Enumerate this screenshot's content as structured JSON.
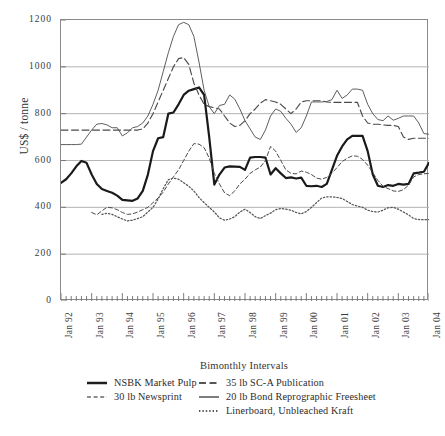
{
  "chart_data": {
    "type": "line",
    "title": "",
    "xlabel": "Bimonthly Intervals",
    "ylabel": "US$ / tonne",
    "ylim": [
      0,
      1200
    ],
    "y_ticks": [
      0,
      200,
      400,
      600,
      800,
      1000,
      1200
    ],
    "grid": true,
    "legend_position": "bottom",
    "x_tick_labels": [
      "Jan 92",
      "Jan 93",
      "Jan 94",
      "Jan 95",
      "Jan 96",
      "Jan 97",
      "Jan 98",
      "Jan 99",
      "Jan 00",
      "Jan 01",
      "Jan 02",
      "Jan 03",
      "Jan 04"
    ],
    "x_interval_note": "bimonthly ticks; labeled each January",
    "n_points": 73,
    "series": [
      {
        "name": "NSBK Market Pulp",
        "style": "solid-thick",
        "color": "#1a1a1a",
        "values": [
          505,
          520,
          545,
          575,
          598,
          590,
          540,
          500,
          478,
          470,
          462,
          450,
          432,
          430,
          428,
          438,
          470,
          540,
          640,
          695,
          700,
          800,
          805,
          840,
          880,
          898,
          905,
          912,
          880,
          700,
          497,
          540,
          570,
          575,
          574,
          573,
          560,
          612,
          615,
          615,
          612,
          540,
          567,
          545,
          525,
          528,
          523,
          527,
          492,
          490,
          492,
          487,
          500,
          560,
          620,
          660,
          690,
          705,
          705,
          705,
          640,
          540,
          492,
          487,
          495,
          492,
          500,
          497,
          500,
          545,
          548,
          552,
          590
        ]
      },
      {
        "name": "30 lb Newsprint",
        "style": "dashed-short",
        "color": "#4a4a4a",
        "values": [
          null,
          null,
          null,
          null,
          null,
          null,
          378,
          368,
          385,
          400,
          398,
          390,
          378,
          370,
          372,
          380,
          390,
          400,
          420,
          440,
          465,
          500,
          530,
          560,
          600,
          640,
          672,
          670,
          655,
          610,
          545,
          500,
          462,
          450,
          470,
          500,
          520,
          545,
          560,
          572,
          600,
          660,
          640,
          600,
          560,
          545,
          543,
          555,
          550,
          540,
          525,
          520,
          528,
          545,
          570,
          595,
          610,
          620,
          618,
          605,
          580,
          548,
          515,
          490,
          480,
          470,
          468,
          475,
          495,
          530,
          540,
          543,
          545
        ]
      },
      {
        "name": "35 lb SC-A Publication",
        "style": "dashed-long",
        "color": "#4a4a4a",
        "values": [
          730,
          730,
          730,
          730,
          730,
          730,
          730,
          730,
          730,
          730,
          730,
          730,
          730,
          730,
          730,
          730,
          735,
          760,
          800,
          850,
          900,
          950,
          1000,
          1035,
          1040,
          1010,
          930,
          880,
          840,
          830,
          825,
          820,
          790,
          760,
          745,
          750,
          770,
          800,
          820,
          845,
          860,
          855,
          850,
          840,
          820,
          800,
          820,
          850,
          855,
          855,
          855,
          855,
          850,
          848,
          848,
          848,
          848,
          848,
          848,
          790,
          760,
          755,
          755,
          752,
          750,
          750,
          745,
          700,
          690,
          695,
          695,
          695,
          695
        ]
      },
      {
        "name": "20 lb Bond Reprographic Freesheet",
        "style": "solid-thin",
        "color": "#555555",
        "values": [
          668,
          668,
          668,
          668,
          670,
          700,
          730,
          755,
          758,
          752,
          740,
          740,
          705,
          718,
          740,
          745,
          760,
          790,
          840,
          900,
          980,
          1060,
          1130,
          1180,
          1190,
          1180,
          1130,
          1020,
          900,
          830,
          800,
          835,
          840,
          880,
          862,
          820,
          770,
          735,
          700,
          690,
          730,
          790,
          820,
          810,
          780,
          755,
          720,
          740,
          790,
          850,
          850,
          850,
          852,
          860,
          900,
          865,
          880,
          905,
          905,
          900,
          840,
          800,
          775,
          770,
          790,
          772,
          780,
          790,
          790,
          790,
          760,
          715,
          712
        ]
      },
      {
        "name": "Linerboard, Unbleached Kraft",
        "style": "dotted",
        "color": "#555555",
        "values": [
          null,
          null,
          null,
          null,
          null,
          null,
          null,
          null,
          370,
          375,
          370,
          360,
          350,
          342,
          345,
          352,
          360,
          380,
          400,
          435,
          480,
          518,
          525,
          520,
          505,
          490,
          470,
          442,
          420,
          400,
          380,
          355,
          345,
          350,
          360,
          380,
          392,
          378,
          360,
          352,
          365,
          375,
          390,
          395,
          392,
          388,
          378,
          372,
          382,
          400,
          420,
          440,
          445,
          445,
          442,
          438,
          425,
          412,
          405,
          400,
          388,
          382,
          380,
          388,
          398,
          400,
          392,
          380,
          368,
          352,
          348,
          347,
          348
        ]
      }
    ]
  },
  "legend": {
    "rows": [
      [
        {
          "label": "NSBK Market Pulp",
          "style": "solid-thick"
        },
        {
          "label": "35 lb SC-A Publication",
          "style": "dashed-long"
        }
      ],
      [
        {
          "label": "30 lb Newsprint",
          "style": "dashed-short"
        },
        {
          "label": "20 lb Bond Reprographic Freesheet",
          "style": "solid-thin"
        }
      ],
      [
        {
          "label": "",
          "style": "none"
        },
        {
          "label": "Linerboard, Unbleached Kraft",
          "style": "dotted"
        }
      ]
    ]
  }
}
